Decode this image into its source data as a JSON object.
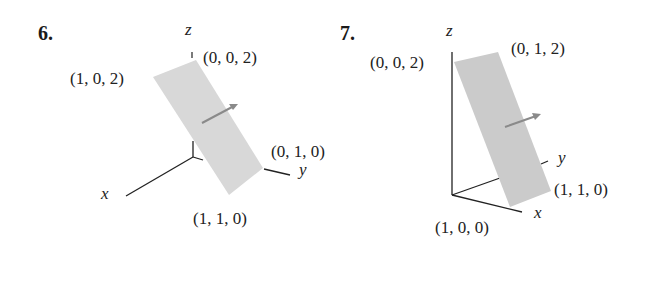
{
  "figures": [
    {
      "number": "6.",
      "axes": {
        "x": "x",
        "y": "y",
        "z": "z"
      },
      "points": {
        "p002": "(0, 0, 2)",
        "p102": "(1, 0, 2)",
        "p010": "(0, 1, 0)",
        "p110": "(1, 1, 0)"
      }
    },
    {
      "number": "7.",
      "axes": {
        "x": "x",
        "y": "y",
        "z": "z"
      },
      "points": {
        "p002": "(0, 0, 2)",
        "p012": "(0, 1, 2)",
        "p110": "(1, 1, 0)",
        "p100": "(1, 0, 0)"
      }
    }
  ],
  "colors": {
    "plane": "#d6d6d6",
    "plane7": "#c9c9c9",
    "arrow": "#8a8a8a",
    "axis": "#222222"
  }
}
